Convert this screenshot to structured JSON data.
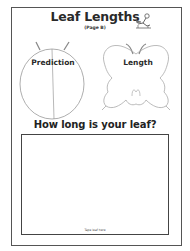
{
  "worksheet": {
    "title": "Leaf Lengths",
    "subtitle": "(Page B)",
    "title_icon": "child-reading-icon",
    "shapes": [
      {
        "kind": "ladybug-outline",
        "label": "Prediction"
      },
      {
        "kind": "butterfly-outline",
        "label": "Length"
      }
    ],
    "question": "How long is your leaf?",
    "tape_box": {
      "label": "Tape leaf here"
    }
  },
  "colors": {
    "frame": "#555555",
    "text": "#2a2a2a",
    "outline": "#9a9a9a",
    "background": "#ffffff"
  }
}
